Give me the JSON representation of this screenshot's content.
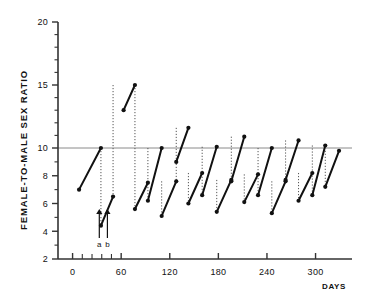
{
  "chart_data": {
    "type": "line",
    "title": "",
    "xlabel": "DAYS",
    "ylabel": "FEMALE-TO-MALE SEX RATIO",
    "xlim": [
      -18,
      345
    ],
    "ylim": [
      2,
      20
    ],
    "grid": false,
    "legend": null,
    "xticks": [
      0,
      60,
      120,
      180,
      240,
      300
    ],
    "xtick_labels": [
      "0",
      "60",
      "120",
      "180",
      "240",
      "300"
    ],
    "x_minor_ticks": [
      12,
      24,
      36,
      48
    ],
    "yticks": [
      2,
      4,
      6,
      8,
      10,
      15,
      20
    ],
    "ytick_labels": [
      "2",
      "4",
      "6",
      "8",
      "10",
      "15",
      "20"
    ],
    "y_minor_ticks": [
      3,
      5,
      7,
      9,
      11,
      12,
      13,
      14,
      16,
      17,
      18,
      19
    ],
    "reference_line": {
      "y": 10,
      "orientation": "horizontal"
    },
    "series": [
      {
        "name": "sex-ratio-cycles",
        "style": "solid-segments-with-dotted-drops",
        "segments": [
          {
            "x": [
              8,
              35
            ],
            "y": [
              7.0,
              10.0
            ]
          },
          {
            "x": [
              35,
              50
            ],
            "y": [
              4.4,
              6.5
            ]
          },
          {
            "x": [
              63,
              77
            ],
            "y": [
              13.0,
              15.0
            ]
          },
          {
            "x": [
              77,
              93
            ],
            "y": [
              5.6,
              7.5
            ]
          },
          {
            "x": [
              93,
              110
            ],
            "y": [
              6.2,
              10.0
            ]
          },
          {
            "x": [
              110,
              128
            ],
            "y": [
              5.1,
              7.6
            ]
          },
          {
            "x": [
              128,
              143
            ],
            "y": [
              9.0,
              11.6
            ]
          },
          {
            "x": [
              143,
              160
            ],
            "y": [
              6.0,
              8.2
            ]
          },
          {
            "x": [
              160,
              178
            ],
            "y": [
              6.6,
              10.1
            ]
          },
          {
            "x": [
              178,
              196
            ],
            "y": [
              5.4,
              7.7
            ]
          },
          {
            "x": [
              196,
              212
            ],
            "y": [
              7.6,
              10.9
            ]
          },
          {
            "x": [
              212,
              229
            ],
            "y": [
              6.1,
              8.1
            ]
          },
          {
            "x": [
              229,
              246
            ],
            "y": [
              6.6,
              10.0
            ]
          },
          {
            "x": [
              246,
              263
            ],
            "y": [
              5.3,
              7.6
            ]
          },
          {
            "x": [
              263,
              279
            ],
            "y": [
              7.7,
              10.6
            ]
          },
          {
            "x": [
              279,
              296
            ],
            "y": [
              6.2,
              8.2
            ]
          },
          {
            "x": [
              296,
              312
            ],
            "y": [
              6.6,
              10.2
            ]
          },
          {
            "x": [
              312,
              329
            ],
            "y": [
              7.2,
              9.8
            ]
          }
        ],
        "drops": [
          {
            "x": 35,
            "y_top": 10.0,
            "y_bottom": 4.4
          },
          {
            "x": 50,
            "y_top": 15.0,
            "y_bottom": 6.5
          },
          {
            "x": 77,
            "y_top": 15.0,
            "y_bottom": 5.6
          },
          {
            "x": 93,
            "y_top": 10.0,
            "y_bottom": 6.2
          },
          {
            "x": 110,
            "y_top": 7.6,
            "y_bottom": 5.1
          },
          {
            "x": 128,
            "y_top": 11.6,
            "y_bottom": 7.6
          },
          {
            "x": 143,
            "y_top": 8.2,
            "y_bottom": 6.0
          },
          {
            "x": 160,
            "y_top": 10.1,
            "y_bottom": 6.6
          },
          {
            "x": 178,
            "y_top": 7.7,
            "y_bottom": 5.4
          },
          {
            "x": 196,
            "y_top": 10.9,
            "y_bottom": 7.6
          },
          {
            "x": 212,
            "y_top": 8.1,
            "y_bottom": 6.1
          },
          {
            "x": 229,
            "y_top": 10.0,
            "y_bottom": 6.6
          },
          {
            "x": 246,
            "y_top": 7.6,
            "y_bottom": 5.3
          },
          {
            "x": 263,
            "y_top": 10.6,
            "y_bottom": 7.7
          },
          {
            "x": 279,
            "y_top": 8.2,
            "y_bottom": 6.2
          },
          {
            "x": 296,
            "y_top": 10.2,
            "y_bottom": 6.6
          },
          {
            "x": 312,
            "y_top": 9.8,
            "y_bottom": 7.2
          }
        ]
      }
    ],
    "annotations": [
      {
        "name": "arrow-a",
        "label": "a",
        "x": 33,
        "type": "up-arrow"
      },
      {
        "name": "arrow-b",
        "label": "b",
        "x": 43,
        "type": "up-arrow"
      }
    ],
    "colors": {
      "line": "#111111",
      "marker": "#111111",
      "dotted": "#555555",
      "axis": "#333333",
      "reference": "#8a8a8a",
      "background": "#ffffff"
    }
  }
}
